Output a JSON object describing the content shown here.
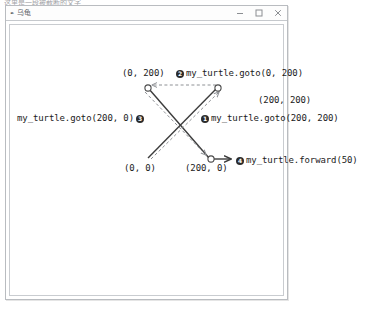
{
  "top_strip": {
    "clipped_text": "这里是一段被截断的文字"
  },
  "window": {
    "title": "乌龟",
    "app_icon": "turtle-pen-icon",
    "controls": [
      {
        "name": "minimize",
        "icon": "minimize-icon"
      },
      {
        "name": "maximize",
        "icon": "maximize-icon"
      },
      {
        "name": "close",
        "icon": "close-icon"
      }
    ]
  },
  "diagram": {
    "type": "turtle-graphics-path",
    "points": {
      "origin": {
        "label": "(0, 0)",
        "x": 148,
        "y": 158
      },
      "top_left": {
        "label": "(0, 200)",
        "x": 148,
        "y": 87
      },
      "top_right": {
        "label": "(200, 200)",
        "x": 218,
        "y": 87
      },
      "bottom_right": {
        "label": "(200, 0)",
        "x": 211,
        "y": 159
      }
    },
    "coordinate_labels": [
      {
        "name": "coord-label-0-200",
        "text": "(0, 200)"
      },
      {
        "name": "coord-label-200-200",
        "text": "(200, 200)"
      },
      {
        "name": "coord-label-0-0",
        "text": "(0, 0)"
      },
      {
        "name": "coord-label-200-0",
        "text": "(200, 0)"
      }
    ],
    "steps": [
      {
        "number": "❶",
        "badge": "1",
        "command": "my_turtle.goto(200, 200)",
        "badge_side": "left"
      },
      {
        "number": "❷",
        "badge": "2",
        "command": "my_turtle.goto(0, 200)",
        "badge_side": "left"
      },
      {
        "number": "❸",
        "badge": "3",
        "command": "my_turtle.goto(200, 0)",
        "badge_side": "right"
      },
      {
        "number": "❹",
        "badge": "4",
        "command": "my_turtle.forward(50)",
        "badge_side": "left"
      }
    ],
    "colors": {
      "solid_line": "#3c3c3c",
      "dashed_line": "#8e9195",
      "node_stroke": "#4a4a4a",
      "text": "#1b1b1b",
      "badge_bg": "#2b2b2b"
    }
  }
}
